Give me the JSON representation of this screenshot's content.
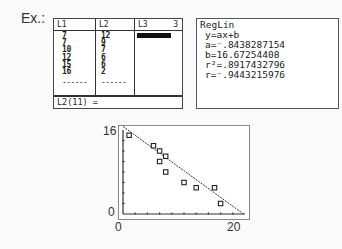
{
  "example_label": "Ex.:",
  "list_editor": {
    "headers": [
      "L1",
      "L2",
      "L3"
    ],
    "column_number": "3",
    "L1": [
      "7",
      "7",
      "10",
      "12",
      "15",
      "16"
    ],
    "L2": [
      "12",
      "9",
      "7",
      "6",
      "6",
      "2"
    ],
    "dashes": "------",
    "edit_line": "L2(11) ="
  },
  "regression": {
    "title": "RegLin",
    "equation": "y=ax+b",
    "a": "a=⁻.8438287154",
    "b": "b=16.67254408",
    "r2": "r²=.8917432796",
    "r": "r=⁻.9443215976"
  },
  "chart_data": {
    "type": "scatter",
    "title": "",
    "xlabel": "",
    "ylabel": "",
    "xlim": [
      0,
      20
    ],
    "ylim": [
      0,
      16
    ],
    "x_tick_labels": [
      "0",
      "20"
    ],
    "y_tick_labels": [
      "0",
      "16"
    ],
    "grid": false,
    "points": [
      {
        "x": 1,
        "y": 15
      },
      {
        "x": 5,
        "y": 13
      },
      {
        "x": 6,
        "y": 12
      },
      {
        "x": 7,
        "y": 11
      },
      {
        "x": 6,
        "y": 10
      },
      {
        "x": 7,
        "y": 8
      },
      {
        "x": 10,
        "y": 6
      },
      {
        "x": 12,
        "y": 5
      },
      {
        "x": 15,
        "y": 5
      },
      {
        "x": 16,
        "y": 2
      }
    ],
    "regression_line": {
      "slope": -0.8438287154,
      "intercept": 16.67254408
    }
  }
}
